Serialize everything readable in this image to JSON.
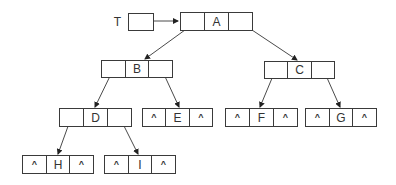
{
  "diagram": {
    "root_pointer": {
      "label": "T",
      "box": {
        "x": 128,
        "y": 13,
        "w": 25,
        "h": 17
      },
      "points_to": "A"
    },
    "null_symbol": "^",
    "colors": {
      "stroke": "#3a3a3a",
      "text": "#333333",
      "background": "#ffffff"
    },
    "nodes": [
      {
        "id": "A",
        "label": "A",
        "x": 180,
        "y": 12,
        "w": 72,
        "h": 18,
        "left": "B",
        "right": "C"
      },
      {
        "id": "B",
        "label": "B",
        "x": 101,
        "y": 60,
        "w": 71,
        "h": 17,
        "left": "D",
        "right": "E"
      },
      {
        "id": "C",
        "label": "C",
        "x": 264,
        "y": 61,
        "w": 70,
        "h": 17,
        "left": "F",
        "right": "G"
      },
      {
        "id": "D",
        "label": "D",
        "x": 59,
        "y": 108,
        "w": 72,
        "h": 18,
        "left": "H",
        "right": "I"
      },
      {
        "id": "E",
        "label": "E",
        "x": 142,
        "y": 108,
        "w": 70,
        "h": 18,
        "left": "^",
        "right": "^"
      },
      {
        "id": "F",
        "label": "F",
        "x": 225,
        "y": 108,
        "w": 72,
        "h": 18,
        "left": "^",
        "right": "^"
      },
      {
        "id": "G",
        "label": "G",
        "x": 305,
        "y": 108,
        "w": 71,
        "h": 18,
        "left": "^",
        "right": "^"
      },
      {
        "id": "H",
        "label": "H",
        "x": 22,
        "y": 155,
        "w": 71,
        "h": 18,
        "left": "^",
        "right": "^"
      },
      {
        "id": "I",
        "label": "I",
        "x": 104,
        "y": 155,
        "w": 71,
        "h": 18,
        "left": "^",
        "right": "^"
      }
    ],
    "edges": [
      {
        "from": "T",
        "to": "A",
        "x1": 140,
        "y1": 21,
        "x2": 178,
        "y2": 21
      },
      {
        "from": "A",
        "to": "B",
        "x1": 196,
        "y1": 22,
        "x2": 145,
        "y2": 59
      },
      {
        "from": "A",
        "to": "C",
        "x1": 240,
        "y1": 22,
        "x2": 297,
        "y2": 60
      },
      {
        "from": "B",
        "to": "D",
        "x1": 113,
        "y1": 70,
        "x2": 95,
        "y2": 107
      },
      {
        "from": "B",
        "to": "E",
        "x1": 162,
        "y1": 70,
        "x2": 179,
        "y2": 107
      },
      {
        "from": "C",
        "to": "F",
        "x1": 275,
        "y1": 71,
        "x2": 260,
        "y2": 107
      },
      {
        "from": "C",
        "to": "G",
        "x1": 324,
        "y1": 71,
        "x2": 340,
        "y2": 107
      },
      {
        "from": "D",
        "to": "H",
        "x1": 71,
        "y1": 118,
        "x2": 58,
        "y2": 154
      },
      {
        "from": "D",
        "to": "I",
        "x1": 120,
        "y1": 118,
        "x2": 138,
        "y2": 154
      }
    ]
  }
}
